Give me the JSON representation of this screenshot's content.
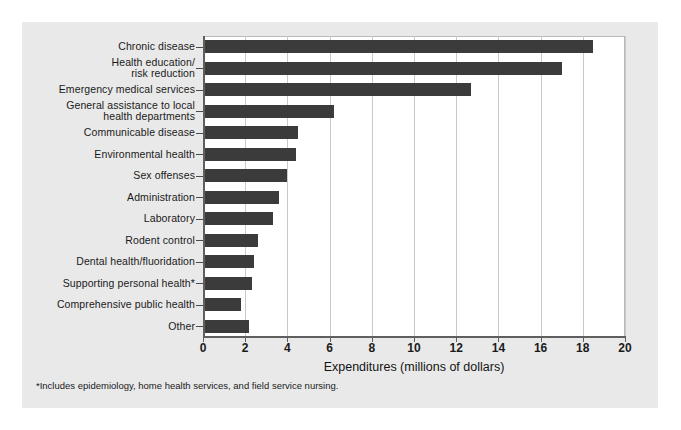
{
  "chart_data": {
    "type": "bar",
    "orientation": "horizontal",
    "title": "",
    "xlabel": "Expenditures (millions of dollars)",
    "ylabel": "",
    "xlim": [
      0,
      20
    ],
    "xticks": [
      0,
      2,
      4,
      6,
      8,
      10,
      12,
      14,
      16,
      18,
      20
    ],
    "grid": true,
    "legend": null,
    "bar_color": "#3b3b3b",
    "plot_background": "#ffffff",
    "panel_background": "#e9e9e9",
    "categories": [
      "Chronic disease",
      "Health education/ risk reduction",
      "Emergency medical services",
      "General assistance to local health departments",
      "Communicable disease",
      "Environmental health",
      "Sex offenses",
      "Administration",
      "Laboratory",
      "Rodent control",
      "Dental health/fluoridation",
      "Supporting personal health*",
      "Comprehensive public health",
      "Other"
    ],
    "category_lines": [
      [
        "Chronic disease"
      ],
      [
        "Health education/",
        "risk reduction"
      ],
      [
        "Emergency medical services"
      ],
      [
        "General assistance to local",
        "health departments"
      ],
      [
        "Communicable disease"
      ],
      [
        "Environmental health"
      ],
      [
        "Sex offenses"
      ],
      [
        "Administration"
      ],
      [
        "Laboratory"
      ],
      [
        "Rodent control"
      ],
      [
        "Dental health/fluoridation"
      ],
      [
        "Supporting personal health*"
      ],
      [
        "Comprehensive public health"
      ],
      [
        "Other"
      ]
    ],
    "values": [
      18.5,
      17.0,
      12.7,
      6.2,
      4.5,
      4.4,
      4.0,
      3.6,
      3.3,
      2.6,
      2.4,
      2.3,
      1.8,
      2.2
    ],
    "annotations": [
      "*Includes epidemiology, home health services, and field service nursing."
    ]
  },
  "footnote": "*Includes epidemiology, home health services, and field service nursing."
}
